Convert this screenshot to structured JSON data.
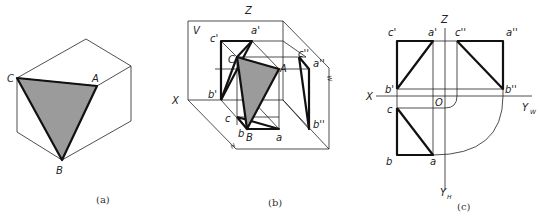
{
  "figure": {
    "panels": [
      {
        "caption": "(a)",
        "labels": {
          "C": "C",
          "A": "A",
          "B": "B"
        }
      },
      {
        "caption": "(b)",
        "labels": {
          "Z": "Z",
          "V": "V",
          "X": "X",
          "W": "W",
          "H": "H",
          "c_prime": "c'",
          "a_prime": "a'",
          "b_prime": "b'",
          "C": "C",
          "A": "A",
          "B": "B",
          "c_dprime": "c''",
          "a_dprime": "a''",
          "b_dprime": "b''",
          "c": "c",
          "b": "b",
          "a": "a"
        }
      },
      {
        "caption": "(c)",
        "labels": {
          "Z": "Z",
          "X": "X",
          "O": "O",
          "Y": "Y",
          "W_sub": "W",
          "H_sub": "H",
          "c_prime": "c'",
          "a_prime": "a'",
          "b_prime": "b'",
          "c_dprime": "c''",
          "a_dprime": "a''",
          "b_dprime": "b''",
          "c": "c",
          "b": "b",
          "a": "a"
        }
      }
    ],
    "colors": {
      "line": "#111111",
      "shade": "#9b9b9b",
      "background": "#ffffff"
    }
  }
}
